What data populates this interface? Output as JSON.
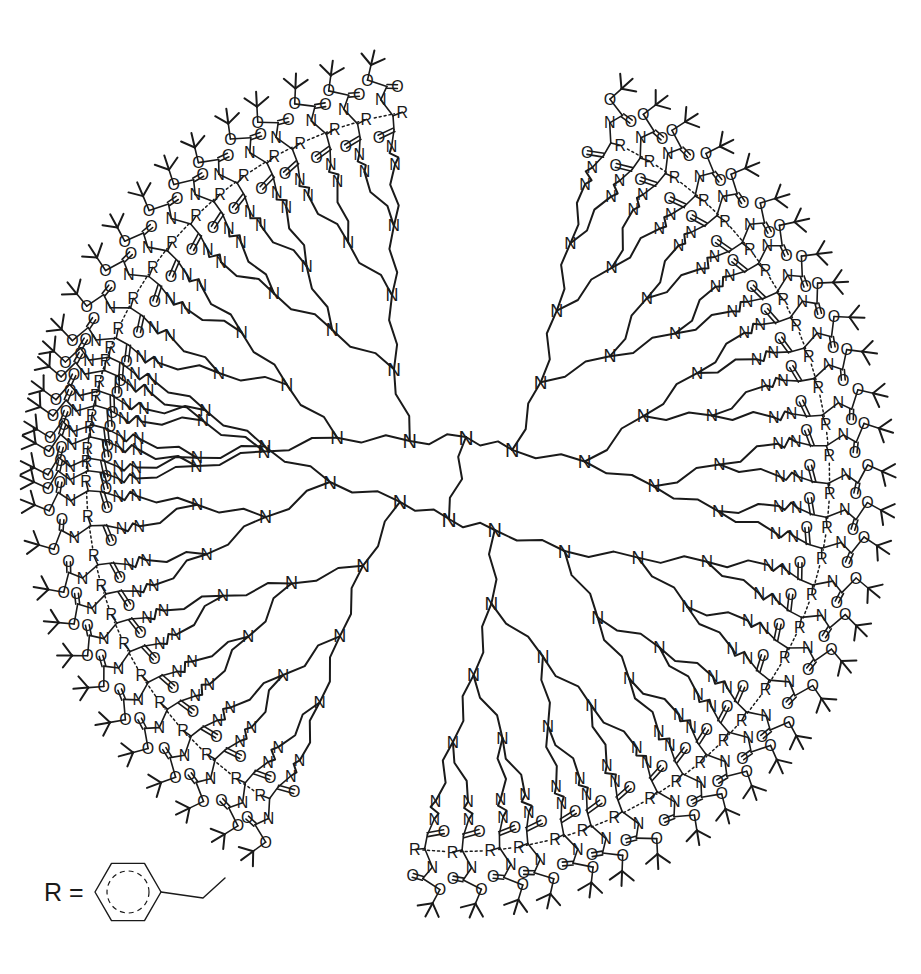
{
  "figure": {
    "name": "dendrimer-structure-diagram",
    "molecule_class": "poly(propylene imine) dendrimer",
    "core_type": "diaminobutane (DAB)",
    "generation": 5,
    "end_group_count": 64,
    "background_color": "#ffffff",
    "ink_color": "#1a1a1a"
  },
  "canvas": {
    "width": 921,
    "height": 974,
    "center_x": 458,
    "center_y": 480,
    "outer_radius": 430
  },
  "core": {
    "name": "diaminobutane-core",
    "nitrogen_label": "N",
    "upper_core_x": 466,
    "upper_core_y": 437,
    "lower_core_x": 449,
    "lower_core_y": 519,
    "bridge_segments": 4
  },
  "labels": {
    "nitrogen": "N",
    "oxygen": "O",
    "r_group": "R",
    "equals": "R ="
  },
  "legend": {
    "name": "r-group-legend",
    "label": "R =",
    "label_x": 44,
    "label_y": 892,
    "group_name": "benzyl",
    "ring_center_x": 128,
    "ring_center_y": 892,
    "ring_radius": 33,
    "inner_circle_radius": 21,
    "ch2_label": "",
    "description": "benzene ring with methylene linker"
  },
  "generations": [
    {
      "index": 1,
      "radius": 62,
      "branches": 4,
      "font_size": 20
    },
    {
      "index": 2,
      "radius": 128,
      "branches": 8,
      "font_size": 19
    },
    {
      "index": 3,
      "radius": 196,
      "branches": 16,
      "font_size": 18
    },
    {
      "index": 4,
      "radius": 262,
      "branches": 32,
      "font_size": 17
    },
    {
      "index": 5,
      "radius": 322,
      "branches": 64,
      "font_size": 16
    }
  ],
  "terminal_shell": {
    "name": "boc-phenylalanine-shell",
    "count": 64,
    "amide_n_radius": 340,
    "carbonyl_c_radius": 356,
    "carbonyl_o_radius": 352,
    "alpha_carbon_radius": 370,
    "r_group_radius": 372,
    "carbamate_n_radius": 388,
    "carbamate_c_radius": 400,
    "carbamate_o_double_radius": 398,
    "ester_o_radius": 410,
    "tbutyl_c_radius": 424,
    "tbutyl_arm_length": 15,
    "sequence": [
      "N",
      "C=O",
      "CH(R)",
      "N",
      "C=O",
      "O",
      "C(CH3)3"
    ],
    "hydrogen_bond_style": "dotted",
    "hydrogen_bond_label": "R···R contact"
  },
  "style": {
    "bond_width": 2.0,
    "thin_bond_width": 1.6,
    "legend_bond_width": 1.4,
    "label_font_size": 17,
    "zigzag_amplitude": 4,
    "dash_pattern": "2,3"
  }
}
